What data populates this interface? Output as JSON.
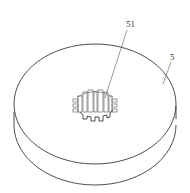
{
  "figure": {
    "labels": [
      {
        "id": "hub",
        "text": "51",
        "refers_to": "splined central hub / bore"
      },
      {
        "id": "disc",
        "text": "5",
        "refers_to": "disc body"
      }
    ],
    "colors": {
      "line": "#3a3a3a",
      "background": "#ffffff"
    }
  }
}
